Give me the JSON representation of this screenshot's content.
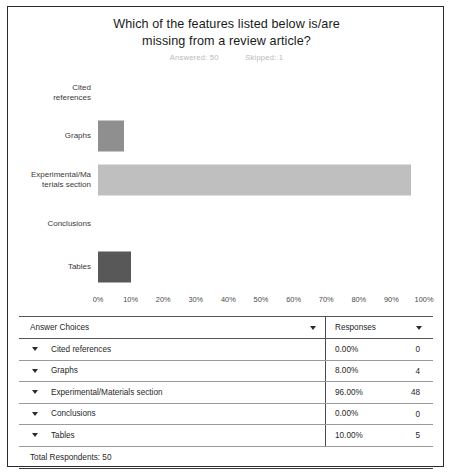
{
  "chart_data": {
    "type": "bar",
    "orientation": "horizontal",
    "title": "Which of the features listed below is/are missing from a review article?",
    "title_line1": "Which of the features listed below is/are",
    "title_line2": "missing from a review article?",
    "subtitle_answered": "Answered: 50",
    "subtitle_skipped": "Skipped: 1",
    "xlabel": "",
    "ylabel": "",
    "xlim": [
      0,
      100
    ],
    "grid": false,
    "legend": "none",
    "x_tick_labels": [
      "0%",
      "10%",
      "20%",
      "30%",
      "40%",
      "50%",
      "60%",
      "70%",
      "80%",
      "90%",
      "100%"
    ],
    "x_tick_values": [
      0,
      10,
      20,
      30,
      40,
      50,
      60,
      70,
      80,
      90,
      100
    ],
    "categories": [
      "Cited\nreferences",
      "Graphs",
      "Experimental/Ma\nterials section",
      "Conclusions",
      "Tables"
    ],
    "values": [
      0,
      8,
      96,
      0,
      10
    ],
    "bar_colors": [
      "#8f8f8f",
      "#8f8f8f",
      "#bfbfbf",
      "#8f8f8f",
      "#585858"
    ]
  },
  "table": {
    "headers": {
      "answer_choices": "Answer Choices",
      "responses": "Responses"
    },
    "rows": [
      {
        "choice": "Cited references",
        "percent": "0.00%",
        "count": "0"
      },
      {
        "choice": "Graphs",
        "percent": "8.00%",
        "count": "4"
      },
      {
        "choice": "Experimental/Materials section",
        "percent": "96.00%",
        "count": "48"
      },
      {
        "choice": "Conclusions",
        "percent": "0.00%",
        "count": "0"
      },
      {
        "choice": "Tables",
        "percent": "10.00%",
        "count": "5"
      }
    ],
    "total_respondents": "Total Respondents: 50"
  }
}
